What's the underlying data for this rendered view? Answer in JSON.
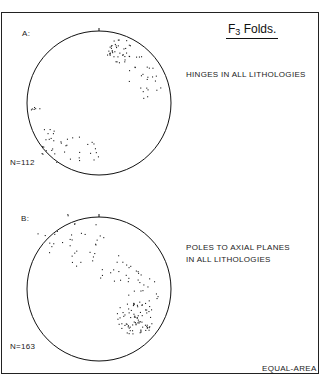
{
  "title": {
    "main": "F",
    "subscript": "3",
    "suffix": " Folds."
  },
  "panels": [
    {
      "label": "A:",
      "description": "HINGES IN ALL LITHOLOGIES",
      "n_label": "N=112",
      "center": [
        99,
        103
      ],
      "radius": 72
    },
    {
      "label": "B:",
      "description_lines": [
        "POLES TO AXIAL PLANES",
        "IN ALL LITHOLOGIES"
      ],
      "n_label": "N=163",
      "center": [
        99,
        289
      ],
      "radius": 72
    }
  ],
  "projection": "EQUAL-AREA",
  "colors": {
    "ink": "#111111",
    "background": "#ffffff"
  }
}
